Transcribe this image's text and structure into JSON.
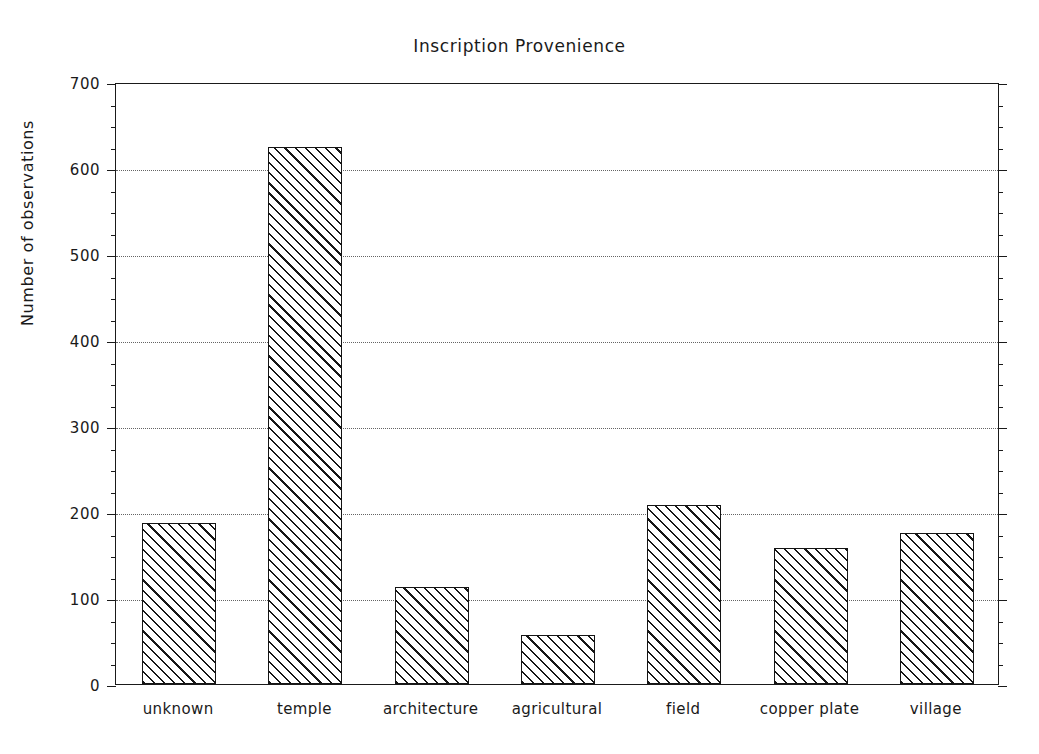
{
  "chart_data": {
    "type": "bar",
    "title": "Inscription Provenience",
    "xlabel": "",
    "ylabel": "Number of observations",
    "categories": [
      "unknown",
      "temple",
      "architecture",
      "agricultural",
      "field",
      "copper plate",
      "village"
    ],
    "values": [
      187,
      625,
      113,
      57,
      208,
      158,
      176
    ],
    "ylim": [
      0,
      700
    ],
    "ytick_labels": [
      "0",
      "100",
      "200",
      "300",
      "400",
      "500",
      "600",
      "700"
    ],
    "ytick_values": [
      0,
      100,
      200,
      300,
      400,
      500,
      600,
      700
    ],
    "yminor_step": 25,
    "grid": "horizontal-dotted",
    "legend": null,
    "bar_style": "diagonal-hatch",
    "bar_fill_color": "#ffffff",
    "bar_edge_color": "#141414",
    "background_color": "#ffffff",
    "axis_color": "#1a1a1a"
  }
}
